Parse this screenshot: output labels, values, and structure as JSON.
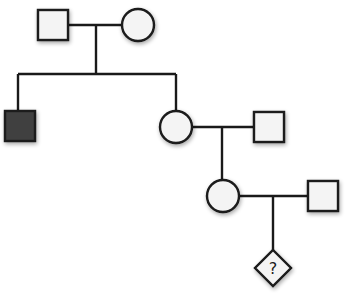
{
  "diagram": {
    "type": "pedigree",
    "colors": {
      "stroke": "#1a1a1a",
      "unaffected_fill": "#f4f4f4",
      "affected_fill": "#404040"
    },
    "generations": [
      {
        "generation": 1,
        "individuals": [
          {
            "id": "I-1",
            "sex": "male",
            "affected": false
          },
          {
            "id": "I-2",
            "sex": "female",
            "affected": false
          }
        ]
      },
      {
        "generation": 2,
        "individuals": [
          {
            "id": "II-1",
            "sex": "male",
            "affected": true
          },
          {
            "id": "II-2",
            "sex": "female",
            "affected": false
          },
          {
            "id": "II-3",
            "sex": "male",
            "affected": false,
            "note": "spouse of II-2"
          }
        ]
      },
      {
        "generation": 3,
        "individuals": [
          {
            "id": "III-1",
            "sex": "female",
            "affected": false
          },
          {
            "id": "III-2",
            "sex": "male",
            "affected": false,
            "note": "spouse of III-1"
          }
        ]
      },
      {
        "generation": 4,
        "individuals": [
          {
            "id": "IV-1",
            "sex": "unknown",
            "affected": "unknown",
            "label": "?"
          }
        ]
      }
    ],
    "unknown_label": "?"
  }
}
